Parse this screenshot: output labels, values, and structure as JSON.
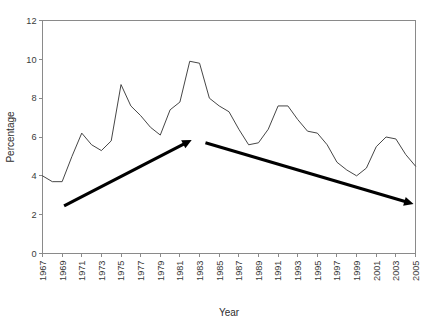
{
  "chart_data": {
    "type": "line",
    "title": "",
    "xlabel": "Year",
    "ylabel": "Percentage",
    "xlim": [
      1967,
      2005
    ],
    "ylim": [
      0,
      12
    ],
    "ytick_step": 2,
    "xtick_step": 2,
    "grid": false,
    "legend": false,
    "ytick_labels": [
      "0",
      "2",
      "4",
      "6",
      "8",
      "10",
      "12"
    ],
    "ytick_values": [
      0,
      2,
      4,
      6,
      8,
      10,
      12
    ],
    "xtick_labels": [
      "1967",
      "1969",
      "1971",
      "1973",
      "1975",
      "1977",
      "1979",
      "1981",
      "1983",
      "1985",
      "1987",
      "1989",
      "1991",
      "1993",
      "1995",
      "1997",
      "1999",
      "2001",
      "2003",
      "2005"
    ],
    "xtick_values": [
      1967,
      1969,
      1971,
      1973,
      1975,
      1977,
      1979,
      1981,
      1983,
      1985,
      1987,
      1989,
      1991,
      1993,
      1995,
      1997,
      1999,
      2001,
      2003,
      2005
    ],
    "x": [
      1967,
      1968,
      1969,
      1970,
      1971,
      1972,
      1973,
      1974,
      1975,
      1976,
      1977,
      1978,
      1979,
      1980,
      1981,
      1982,
      1983,
      1984,
      1985,
      1986,
      1987,
      1988,
      1989,
      1990,
      1991,
      1992,
      1993,
      1994,
      1995,
      1996,
      1997,
      1998,
      1999,
      2000,
      2001,
      2002,
      2003,
      2004,
      2005
    ],
    "values": [
      4.0,
      3.7,
      3.7,
      5.0,
      6.2,
      5.6,
      5.3,
      5.8,
      8.7,
      7.6,
      7.1,
      6.5,
      6.1,
      7.4,
      7.8,
      9.9,
      9.8,
      8.0,
      7.6,
      7.3,
      6.4,
      5.6,
      5.7,
      6.4,
      7.6,
      7.6,
      6.9,
      6.3,
      6.2,
      5.6,
      4.7,
      4.3,
      4.0,
      4.4,
      5.5,
      6.0,
      5.9,
      5.1,
      4.5
    ],
    "annotations": [
      {
        "name": "rising-trend-arrow",
        "kind": "arrow",
        "from": {
          "year": 1969.2,
          "value": 2.45
        },
        "to": {
          "year": 1982.2,
          "value": 5.85
        },
        "direction": "up"
      },
      {
        "name": "falling-trend-arrow",
        "kind": "arrow",
        "from": {
          "year": 1983.6,
          "value": 5.7
        },
        "to": {
          "year": 2004.8,
          "value": 2.55
        },
        "direction": "down"
      }
    ],
    "series": [
      {
        "name": "percentage",
        "values": [
          4.0,
          3.7,
          3.7,
          5.0,
          6.2,
          5.6,
          5.3,
          5.8,
          8.7,
          7.6,
          7.1,
          6.5,
          6.1,
          7.4,
          7.8,
          9.9,
          9.8,
          8.0,
          7.6,
          7.3,
          6.4,
          5.6,
          5.7,
          6.4,
          7.6,
          7.6,
          6.9,
          6.3,
          6.2,
          5.6,
          4.7,
          4.3,
          4.0,
          4.4,
          5.5,
          6.0,
          5.9,
          5.1,
          4.5
        ]
      }
    ]
  },
  "axes": {
    "y_title": "Percentage",
    "x_title": "Year"
  }
}
